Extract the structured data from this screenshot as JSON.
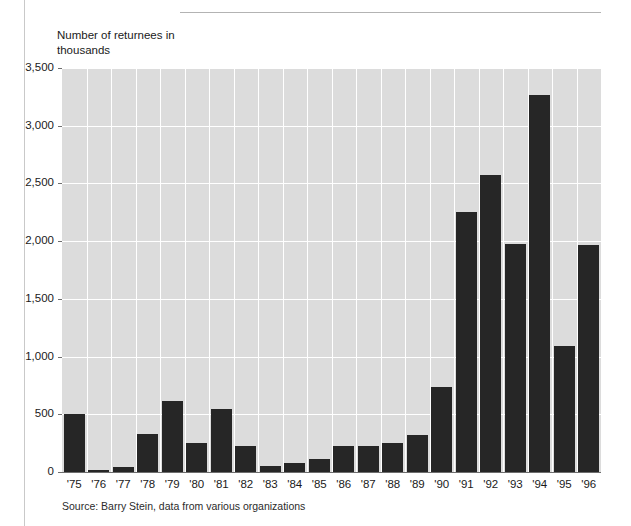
{
  "figure": {
    "y_axis_title": "Number of returnees in\nthousands",
    "source_note": "Source: Barry Stein, data from various organizations"
  },
  "chart_data": {
    "type": "bar",
    "title": "",
    "subtitle": "",
    "xlabel": "",
    "ylabel": "Number of returnees in thousands",
    "ylim": [
      0,
      3500
    ],
    "ytick_labels": [
      "0",
      "500",
      "1,000",
      "1,500",
      "2,000",
      "2,500",
      "3,000",
      "3,500"
    ],
    "ytick_values": [
      0,
      500,
      1000,
      1500,
      2000,
      2500,
      3000,
      3500
    ],
    "grid": true,
    "legend": "none",
    "bar_color": "#262626",
    "plot_background": "#dcdcdc",
    "gridline_color": "#ffffff",
    "categories": [
      "'75",
      "'76",
      "'77",
      "'78",
      "'79",
      "'80",
      "'81",
      "'82",
      "'83",
      "'84",
      "'85",
      "'86",
      "'87",
      "'88",
      "'89",
      "'90",
      "'91",
      "'92",
      "'93",
      "'94",
      "'95",
      "'96"
    ],
    "values": [
      500,
      20,
      40,
      330,
      615,
      250,
      545,
      225,
      55,
      80,
      110,
      225,
      225,
      250,
      325,
      740,
      2255,
      2570,
      1975,
      3265,
      1090,
      1970
    ],
    "annotations": [
      "Source: Barry Stein, data from various organizations"
    ]
  }
}
